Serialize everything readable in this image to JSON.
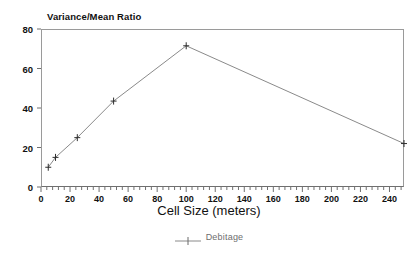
{
  "chart_data": {
    "type": "line",
    "title": "Variance/Mean Ratio",
    "xlabel": "Cell Size (meters)",
    "ylabel": "",
    "xlim": [
      0,
      250
    ],
    "ylim": [
      0,
      80
    ],
    "grid": false,
    "legend_position": "bottom",
    "xticks": [
      0,
      20,
      40,
      60,
      80,
      100,
      120,
      140,
      160,
      180,
      200,
      220,
      240
    ],
    "yticks": [
      0,
      20,
      40,
      60,
      80
    ],
    "minor_ticks_per_major_x": 5,
    "series": [
      {
        "name": "Debitage",
        "marker": "plus",
        "color": "#8a8a8a",
        "x": [
          5,
          10,
          25,
          50,
          100,
          250
        ],
        "values": [
          10,
          15,
          25,
          43.5,
          71.5,
          22
        ]
      }
    ]
  },
  "legend": {
    "entries": [
      {
        "label": "Debitage",
        "marker_name": "line-plus-marker"
      }
    ]
  },
  "axes": {
    "y_tick_labels": [
      "0",
      "20",
      "40",
      "60",
      "80"
    ],
    "x_tick_labels": [
      "0",
      "20",
      "40",
      "60",
      "80",
      "100",
      "120",
      "140",
      "160",
      "180",
      "200",
      "220",
      "240"
    ],
    "x_axis_title": "Cell Size (meters)",
    "y_axis_title": "Variance/Mean Ratio"
  },
  "colors": {
    "series_line": "#8a8a8a",
    "frame": "#9a9a9a",
    "text": "#111111",
    "legend_text": "#6e6e6e"
  }
}
